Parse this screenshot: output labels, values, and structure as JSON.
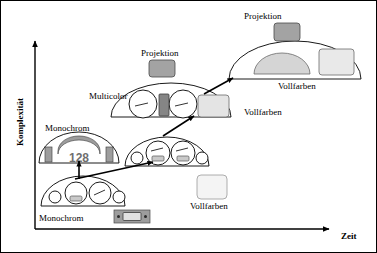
{
  "figure": {
    "title_present": false,
    "background": "#ffffff",
    "border_color": "#000000",
    "width": 377,
    "height": 253
  },
  "axes": {
    "y_label": "Komplexität",
    "x_label": "Zeit",
    "y_axis": {
      "x": 34,
      "top": 37,
      "bottom": 228
    },
    "x_axis": {
      "y": 228,
      "left": 34,
      "right": 334
    },
    "arrowheads": "both-ends-outward",
    "ticks": [],
    "gridlines": false
  },
  "colors": {
    "outline": "#000000",
    "display_dark_gray": "#8c8c8c",
    "display_mid_gray": "#b3b3b3",
    "display_light_gray": "#d8d8d8",
    "display_pale": "#efefef",
    "lcd_text": "#6f6f6f",
    "panel_fill": "#ffffff"
  },
  "stages": [
    {
      "id": "stage-1-monochrom",
      "caption": "Monochrom",
      "caption_pos": {
        "x": 38,
        "y": 218
      },
      "display_type": "segment-lcd",
      "note": "earliest generation: four analogue round gauges, small monochrome segment display",
      "gauges": 4,
      "badge": {
        "label_type": "monochrome-lcd-strip",
        "x": 113,
        "y": 209,
        "w": 36,
        "h": 13
      }
    },
    {
      "id": "stage-2-monochrom-128",
      "caption": "Monochrom",
      "caption_pos": {
        "x": 44,
        "y": 128
      },
      "display_type": "monochrome-dot-matrix",
      "lcd_value": "128",
      "note": "dome cluster with central arc display reading 128 and two vertical bar gauges"
    },
    {
      "id": "stage-3-intermediate",
      "caption": "",
      "display_type": "analogue-with-small-lcd",
      "gauges": 4,
      "note": "four gauges, two inner gauges carry small grey LCD windows"
    },
    {
      "id": "stage-4-multicolor",
      "caption": "Multicolor",
      "caption_pos": {
        "x": 88,
        "y": 96
      },
      "secondary_caption": "Vollfarben",
      "secondary_caption_pos": {
        "x": 243,
        "y": 112
      },
      "display_type": "multicolor-tft",
      "gauges": 2,
      "note": "two round gauges, dark central bar display, full colour rectangular screen right"
    },
    {
      "id": "stage-5-vollfarben",
      "caption": "Vollfarben",
      "caption_pos": {
        "x": 277,
        "y": 86
      },
      "display_type": "full-colour-cluster",
      "note": "wide dome with large half-dome colour display and rectangular colour screen"
    }
  ],
  "projection_nodes": [
    {
      "id": "projection-mid",
      "label": "Projektion",
      "label_pos": {
        "x": 140,
        "y": 54
      },
      "box": {
        "x": 148,
        "y": 59,
        "w": 26,
        "h": 16
      },
      "fill": "#a8a8a8"
    },
    {
      "id": "projection-top",
      "label": "Projektion",
      "label_pos": {
        "x": 240,
        "y": 17
      },
      "box": {
        "x": 273,
        "y": 22,
        "w": 26,
        "h": 17
      },
      "fill": "#a8a8a8"
    }
  ],
  "standalone_displays": [
    {
      "id": "vollfarben-free-box",
      "label": "Vollfarben",
      "label_pos": {
        "x": 189,
        "y": 208
      },
      "box": {
        "x": 196,
        "y": 174,
        "w": 30,
        "h": 24
      },
      "fill": "#f2f2f2"
    }
  ],
  "labels": [
    {
      "text": "Komplexität",
      "role": "y-axis-title"
    },
    {
      "text": "Zeit",
      "role": "x-axis-title"
    },
    {
      "text": "Monochrom",
      "role": "stage-caption"
    },
    {
      "text": "Monochrom",
      "role": "stage-caption"
    },
    {
      "text": "Multicolor",
      "role": "stage-caption"
    },
    {
      "text": "Vollfarben",
      "role": "stage-caption"
    },
    {
      "text": "Vollfarben",
      "role": "stage-caption"
    },
    {
      "text": "Vollfarben",
      "role": "stage-caption"
    },
    {
      "text": "Projektion",
      "role": "node-caption"
    },
    {
      "text": "Projektion",
      "role": "node-caption"
    },
    {
      "text": "128",
      "role": "lcd-readout"
    }
  ],
  "arrows": [
    {
      "id": "arrow-up-to-128",
      "from": [
        78,
        176
      ],
      "to": [
        78,
        158
      ],
      "direction": "up"
    },
    {
      "id": "arrow-stage1-to-stage3",
      "from": [
        78,
        176
      ],
      "to": [
        152,
        160
      ],
      "direction": "up-right"
    },
    {
      "id": "arrow-stage3-to-multicolor",
      "from": [
        163,
        133
      ],
      "to": [
        192,
        113
      ],
      "direction": "up-right"
    },
    {
      "id": "arrow-multicolor-to-vollfarben",
      "from": [
        205,
        92
      ],
      "to": [
        231,
        76
      ],
      "direction": "up-right"
    }
  ]
}
